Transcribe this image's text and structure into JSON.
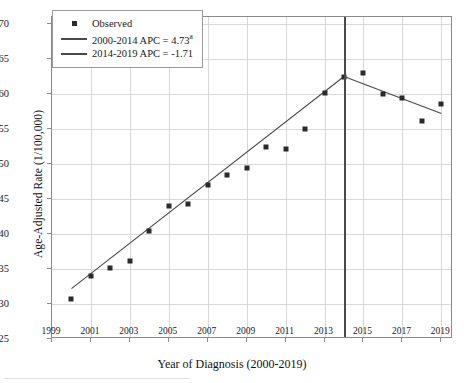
{
  "chart_data": {
    "type": "scatter",
    "title": "",
    "xlabel": "Year of Diagnosis (2000-2019)",
    "ylabel": "Age-Adjusted Rate (1/100,000)",
    "xlim": [
      1999,
      2019.6
    ],
    "ylim": [
      25,
      71
    ],
    "grid": true,
    "legend_position": "top-left",
    "x_ticks": [
      "1999",
      "2001",
      "2003",
      "2005",
      "2007",
      "2009",
      "2011",
      "2013",
      "2015",
      "2017",
      "2019"
    ],
    "x_tick_values": [
      1999,
      2001,
      2003,
      2005,
      2007,
      2009,
      2011,
      2013,
      2015,
      2017,
      2019
    ],
    "y_ticks": [
      "25",
      "30",
      "35",
      "40",
      "45",
      "50",
      "55",
      "60",
      "65",
      "70"
    ],
    "y_tick_values": [
      25,
      30,
      35,
      40,
      45,
      50,
      55,
      60,
      65,
      70
    ],
    "observed": {
      "name": "Observed",
      "x": [
        2000,
        2001,
        2002,
        2003,
        2004,
        2005,
        2006,
        2007,
        2008,
        2009,
        2010,
        2011,
        2012,
        2013,
        2014,
        2015,
        2016,
        2017,
        2018,
        2019
      ],
      "values": [
        30.7,
        34.0,
        35.2,
        36.1,
        40.5,
        44.0,
        44.3,
        47.0,
        48.4,
        49.5,
        52.5,
        52.1,
        55.0,
        60.2,
        62.5,
        63.0,
        60.0,
        59.5,
        56.2,
        58.6
      ]
    },
    "trend_segments": [
      {
        "name": "2000-2014 APC = 4.73",
        "label_suffix": "a",
        "apc": 4.73,
        "x": [
          2000,
          2014
        ],
        "y": [
          32.2,
          62.5
        ],
        "color": "#4a4a4a"
      },
      {
        "name": "2014-2019 APC = -1.71",
        "label_suffix": "",
        "apc": -1.71,
        "x": [
          2014,
          2019
        ],
        "y": [
          62.5,
          57.2
        ],
        "color": "#4a4a4a"
      }
    ],
    "joinpoint": {
      "year": 2014,
      "label": "joinpoint-2014",
      "color": "#4a4a4a"
    }
  },
  "legend": {
    "items": [
      {
        "key": "marker",
        "label": "Observed",
        "sup": ""
      },
      {
        "key": "line",
        "label": "2000-2014 APC  =  4.73",
        "sup": "a"
      },
      {
        "key": "line",
        "label": "2014-2019 APC  =  -1.71",
        "sup": ""
      }
    ]
  },
  "axes": {
    "x_title": "Year of Diagnosis (2000-2019)",
    "y_title": "Age-Adjusted Rate (1/100,000)"
  },
  "colors": {
    "marker": "#2b2b2b",
    "trend": "#4a4a4a",
    "grid": "#d8d8dc",
    "frame": "#8a8a8a"
  }
}
